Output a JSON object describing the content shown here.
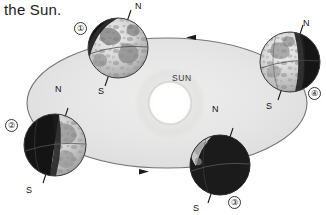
{
  "figure": {
    "caption_fragment": "the Sun.",
    "sun_label": "SUN",
    "orbit": {
      "direction": "counterclockwise",
      "arrow_top": "arrow-left",
      "arrow_bottom": "arrow-right"
    },
    "positions": [
      {
        "id": "1",
        "number_label": "①",
        "north_label": "N",
        "south_label": "S",
        "lit_side": "lower-right",
        "shadow_side": "upper-left",
        "cx": 118,
        "cy": 48,
        "r": 30,
        "tilt_deg": 23.5
      },
      {
        "id": "2",
        "number_label": "②",
        "north_label": "N",
        "south_label": "S",
        "lit_side": "right",
        "shadow_side": "left",
        "cx": 55,
        "cy": 145,
        "r": 31,
        "tilt_deg": 23.5
      },
      {
        "id": "3",
        "number_label": "③",
        "north_label": "N",
        "south_label": "S",
        "lit_side": "upper-left",
        "shadow_side": "lower-right",
        "cx": 220,
        "cy": 165,
        "r": 30,
        "tilt_deg": 23.5
      },
      {
        "id": "4",
        "number_label": "④",
        "north_label": "N",
        "south_label": "S",
        "lit_side": "left",
        "shadow_side": "right",
        "cx": 290,
        "cy": 62,
        "r": 30,
        "tilt_deg": 23.5
      }
    ]
  },
  "labels": {
    "n1": "N",
    "s1": "S",
    "num1": "①",
    "n2": "N",
    "s2": "S",
    "num2": "②",
    "n3": "N",
    "s3": "S",
    "num3": "③",
    "n4": "N",
    "s4": "S",
    "num4": "④"
  },
  "colors": {
    "orbit_fill": "#e3e3e3",
    "orbit_stroke": "#6f6f6f",
    "sun_glow": "#fdfdfb",
    "globe_dark": "#1d1d1d",
    "globe_light": "#d8d8d8",
    "text": "#151515",
    "background": "#ffffff"
  }
}
